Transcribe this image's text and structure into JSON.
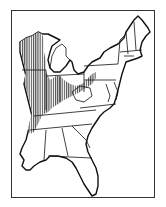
{
  "map": {
    "title": "",
    "region": "Eastern United States",
    "legend": [],
    "layers": [
      {
        "name": "state-boundaries",
        "style": "outline"
      },
      {
        "name": "range-distribution",
        "style": "vertical-hatch"
      }
    ],
    "colors": {
      "background": "#ffffff",
      "outline": "#111111",
      "hatch": "#222222",
      "frame": "#333333"
    }
  }
}
